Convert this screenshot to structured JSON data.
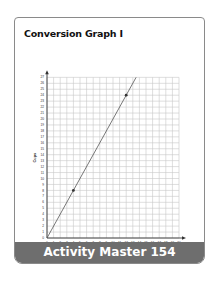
{
  "page": {
    "title": "Conversion Graph I",
    "footer": "Activity Master 154"
  },
  "colors": {
    "grid": "#c8c8c8",
    "axis": "#333333",
    "line": "#555555",
    "footer_bg": "#6e6e6e"
  },
  "chart_data": {
    "type": "line",
    "title": "Conversion Graph I",
    "xlabel": "Pints",
    "ylabel": "Cups",
    "xlim": [
      0,
      20
    ],
    "ylim": [
      0,
      27
    ],
    "x_ticks": [
      0,
      1,
      2,
      3,
      4,
      5,
      6,
      7,
      8,
      9,
      10,
      11,
      12,
      13,
      14,
      15,
      16,
      17,
      18,
      19,
      20
    ],
    "y_ticks": [
      0,
      1,
      2,
      3,
      4,
      5,
      6,
      7,
      8,
      9,
      10,
      11,
      12,
      13,
      14,
      15,
      16,
      17,
      18,
      19,
      20,
      21,
      22,
      23,
      24,
      25,
      26,
      27
    ],
    "grid": true,
    "series": [
      {
        "name": "Cups vs Pints",
        "x": [
          0,
          4,
          12,
          13.5
        ],
        "y": [
          0,
          8,
          24,
          27
        ]
      }
    ],
    "marked_points": [
      {
        "x": 4,
        "y": 8
      },
      {
        "x": 12,
        "y": 24
      }
    ]
  }
}
